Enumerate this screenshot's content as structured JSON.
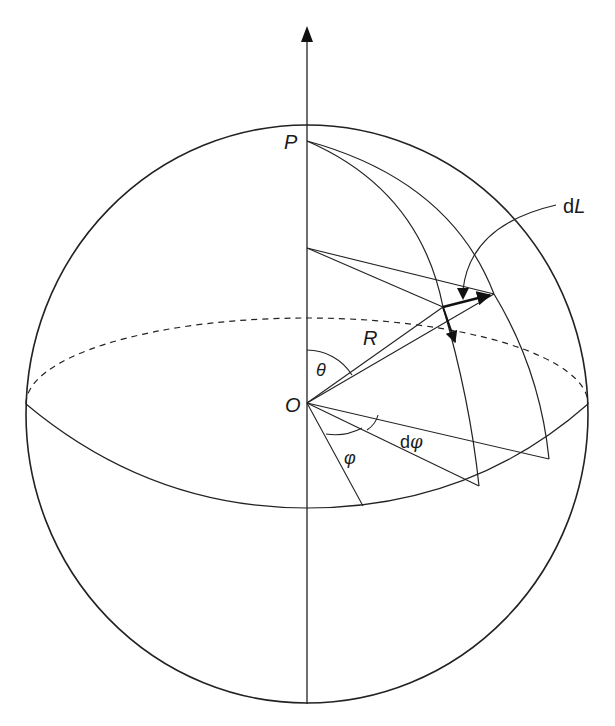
{
  "diagram": {
    "labels": {
      "pole": "P",
      "origin": "O",
      "radius": "R",
      "polar_angle": "θ",
      "azimuth_angle": "φ",
      "azimuth_increment": "dφ",
      "length_element": "dL",
      "length_element_prefix": "d",
      "length_element_var": "L"
    },
    "colors": {
      "stroke": "#222222",
      "background": "#ffffff"
    }
  }
}
